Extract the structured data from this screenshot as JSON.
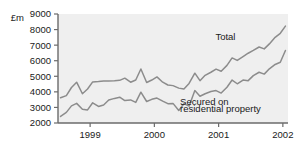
{
  "chart_data": {
    "type": "line",
    "title": "",
    "subtitle": "",
    "xlabel": "",
    "ylabel": "£m",
    "ylim": [
      2000,
      9000
    ],
    "xlim": [
      1998.5,
      2002.08
    ],
    "grid": false,
    "legend_position": "inline-annotation",
    "yticks": [
      2000,
      3000,
      4000,
      5000,
      6000,
      7000,
      8000,
      9000
    ],
    "ytick_labels": [
      "2000",
      "3000",
      "4000",
      "5000",
      "6000",
      "7000",
      "8000",
      "9000"
    ],
    "xticks": [
      1999,
      2000,
      2001,
      2002
    ],
    "xtick_labels": [
      "1999",
      "2000",
      "2001",
      "2002"
    ],
    "x": [
      1998.54,
      1998.63,
      1998.71,
      1998.79,
      1998.88,
      1998.96,
      1999.04,
      1999.13,
      1999.21,
      1999.29,
      1999.38,
      1999.46,
      1999.54,
      1999.63,
      1999.71,
      1999.79,
      1999.88,
      1999.96,
      2000.04,
      2000.13,
      2000.21,
      2000.29,
      2000.38,
      2000.46,
      2000.54,
      2000.63,
      2000.71,
      2000.79,
      2000.88,
      2000.96,
      2001.04,
      2001.13,
      2001.21,
      2001.29,
      2001.38,
      2001.46,
      2001.54,
      2001.63,
      2001.71,
      2001.79,
      2001.88,
      2001.96,
      2002.04
    ],
    "series": [
      {
        "name": "Total",
        "color": "#8c8c8c",
        "label_text": "Total",
        "values": [
          3620,
          3760,
          4280,
          4620,
          3880,
          4180,
          4640,
          4660,
          4700,
          4700,
          4710,
          4740,
          4880,
          4620,
          4760,
          5470,
          4600,
          4760,
          4960,
          4620,
          4440,
          4400,
          4240,
          4180,
          4540,
          5200,
          4720,
          5060,
          5260,
          5460,
          5320,
          5700,
          6180,
          6020,
          6260,
          6480,
          6660,
          6880,
          6760,
          7080,
          7500,
          7760,
          8220
        ]
      },
      {
        "name": "Secured on residential property",
        "color": "#8c8c8c",
        "label_text": "Secured on\nresidential property",
        "values": [
          2420,
          2680,
          3100,
          3260,
          2880,
          2840,
          3300,
          3060,
          3160,
          3480,
          3580,
          3660,
          3440,
          3480,
          3320,
          3980,
          3380,
          3520,
          3600,
          3400,
          3240,
          3260,
          2800,
          3240,
          3080,
          4080,
          3720,
          3880,
          4020,
          4080,
          3920,
          4300,
          4760,
          4520,
          4760,
          4720,
          5040,
          5260,
          5140,
          5480,
          5760,
          5900,
          6660
        ]
      }
    ],
    "annotations": [
      {
        "text": "Total",
        "x": 2000.95,
        "y": 7350
      },
      {
        "text": "Secured on",
        "x": 2000.4,
        "y": 3180
      },
      {
        "text": "residential property",
        "x": 2000.4,
        "y": 2680
      }
    ]
  },
  "style": {
    "plot_background": "#efefef",
    "axis_color": "#6b6b6b",
    "line_color": "#8c8c8c",
    "text_color": "#1a1a1a",
    "page_background": "#ffffff"
  }
}
